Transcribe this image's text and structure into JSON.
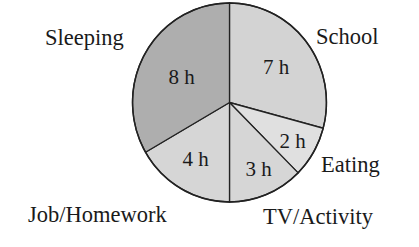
{
  "chart_data": {
    "type": "pie",
    "title": "",
    "unit": "h",
    "total": 24,
    "start_angle_deg": 0,
    "direction": "clockwise",
    "categories": [
      "School",
      "Eating",
      "TV/Activity",
      "Job/Homework",
      "Sleeping"
    ],
    "values": [
      7,
      2,
      3,
      4,
      8
    ],
    "value_labels": [
      "7 h",
      "2 h",
      "3 h",
      "4 h",
      "8 h"
    ],
    "colors": [
      "#d3d3d3",
      "#e0e0e0",
      "#d6d6d6",
      "#d6d6d6",
      "#aeaeae"
    ],
    "legend": "none",
    "labels_position": "outside category names, inside value labels"
  },
  "slices": [
    {
      "name": "School",
      "value": 7,
      "value_label": "7 h",
      "color": "#d3d3d3"
    },
    {
      "name": "Eating",
      "value": 2,
      "value_label": "2 h",
      "color": "#e0e0e0"
    },
    {
      "name": "TV/Activity",
      "value": 3,
      "value_label": "3 h",
      "color": "#d6d6d6"
    },
    {
      "name": "Job/Homework",
      "value": 4,
      "value_label": "4 h",
      "color": "#d6d6d6"
    },
    {
      "name": "Sleeping",
      "value": 8,
      "value_label": "8 h",
      "color": "#aeaeae"
    }
  ],
  "layout": {
    "cx": 229.5,
    "cy": 102.5,
    "rx": 97,
    "ry": 99.5,
    "value_label_pos": [
      {
        "x": 276,
        "y": 74
      },
      {
        "x": 292.5,
        "y": 148
      },
      {
        "x": 258.5,
        "y": 176
      },
      {
        "x": 195.5,
        "y": 166
      },
      {
        "x": 181.5,
        "y": 84
      }
    ],
    "category_label_pos": [
      {
        "x": 316,
        "y": 44,
        "anchor": "start"
      },
      {
        "x": 321,
        "y": 172,
        "anchor": "start"
      },
      {
        "x": 263,
        "y": 224,
        "anchor": "start"
      },
      {
        "x": 28,
        "y": 222,
        "anchor": "start"
      },
      {
        "x": 45,
        "y": 45,
        "anchor": "start"
      }
    ],
    "stroke_color": "#222222"
  }
}
